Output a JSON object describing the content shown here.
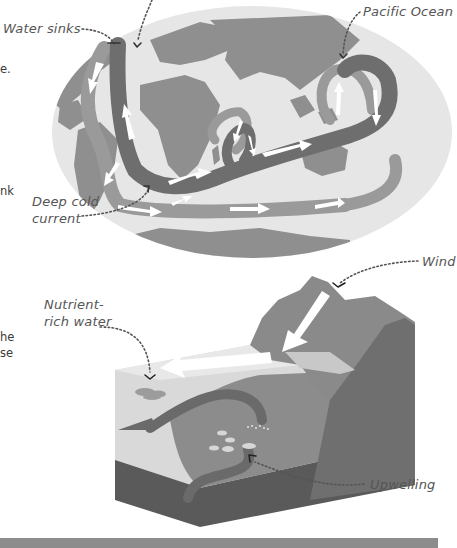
{
  "page": {
    "left_text_fragments": [
      {
        "text": "e.",
        "x": 0,
        "y": 70
      },
      {
        "text": "nk",
        "x": 0,
        "y": 192
      },
      {
        "text": "he",
        "x": 0,
        "y": 336
      },
      {
        "text": "se",
        "x": 0,
        "y": 352
      }
    ]
  },
  "globe_diagram": {
    "labels": {
      "water_sinks": "Water sinks",
      "pacific_ocean": "Pacific Ocean",
      "deep_cold_current_line1": "Deep cold",
      "deep_cold_current_line2": "current"
    }
  },
  "upwelling_diagram": {
    "labels": {
      "wind": "Wind",
      "nutrient_line1": "Nutrient-",
      "nutrient_line2": "rich water",
      "upwelling": "Upwelling"
    }
  },
  "colors": {
    "ocean_light": "#e6e6e6",
    "land": "#8f8f8f",
    "current_dark": "#6e6e6e",
    "current_light": "#9a9a9a",
    "arrow": "#ffffff",
    "label_text": "#555555",
    "mountain": "#8a8a8a",
    "mountain_dark": "#6f6f6f",
    "water_surface": "#d9d9d9",
    "block_side": "#5a5a5a",
    "bottom_bar": "#8c8c8c"
  }
}
